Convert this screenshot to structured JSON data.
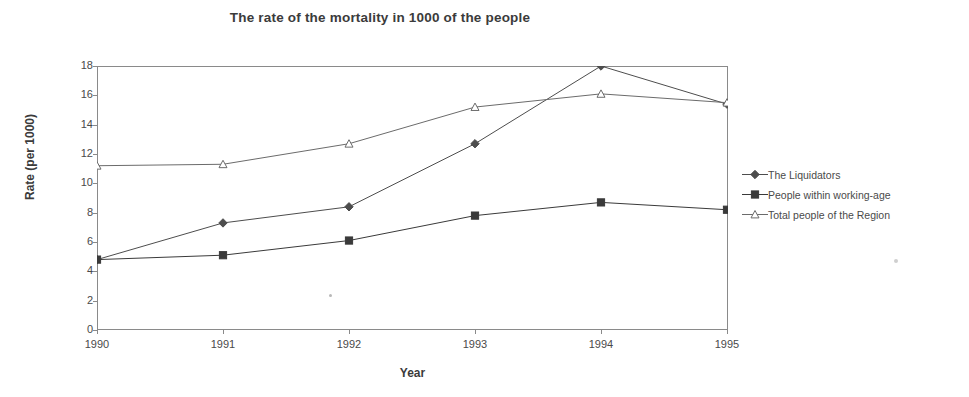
{
  "chart_data": {
    "type": "line",
    "title": "The rate of the mortality in 1000 of the people",
    "xlabel": "Year",
    "ylabel": "Rate (per 1000)",
    "categories": [
      "1990",
      "1991",
      "1992",
      "1993",
      "1994",
      "1995"
    ],
    "x": [
      1990,
      1991,
      1992,
      1993,
      1994,
      1995
    ],
    "xlim": [
      1990,
      1995
    ],
    "ylim": [
      0,
      18
    ],
    "yticks": [
      0,
      2,
      4,
      6,
      8,
      10,
      12,
      14,
      16,
      18
    ],
    "grid": false,
    "legend_position": "right",
    "series": [
      {
        "name": "The Liquidators",
        "marker": "filled-diamond",
        "color": "#4d4d4d",
        "values": [
          4.8,
          7.3,
          8.4,
          12.7,
          18.0,
          15.4
        ]
      },
      {
        "name": "People within working-age",
        "marker": "filled-square",
        "color": "#3a3a3a",
        "values": [
          4.8,
          5.1,
          6.1,
          7.8,
          8.7,
          8.2
        ]
      },
      {
        "name": "Total people of the Region",
        "marker": "open-triangle",
        "color": "#6b6b6b",
        "values": [
          11.2,
          11.3,
          12.7,
          15.2,
          16.1,
          15.5
        ]
      }
    ]
  },
  "legend": {
    "items": [
      {
        "label": "The Liquidators",
        "marker": "filled-diamond"
      },
      {
        "label": "People within working-age",
        "marker": "filled-square"
      },
      {
        "label": "Total people of the Region",
        "marker": "open-triangle"
      }
    ]
  }
}
